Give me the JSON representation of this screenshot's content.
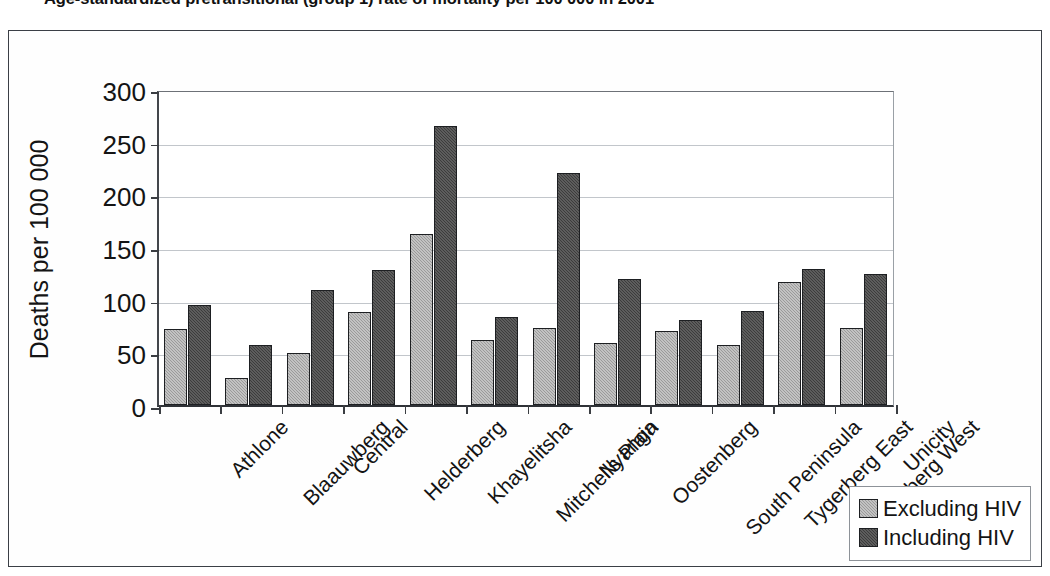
{
  "chart_data": {
    "type": "bar",
    "title": "Age-standardized pretransitional (group 1) rate of mortality per 100 000 in 2001",
    "xlabel": "",
    "ylabel": "Deaths per 100 000",
    "ylim": [
      0,
      300
    ],
    "ytick_values": [
      0,
      50,
      100,
      150,
      200,
      250,
      300
    ],
    "ytick_labels": [
      "0",
      "50",
      "100",
      "150",
      "200",
      "250",
      "300"
    ],
    "grid": "horizontal",
    "legend_position": "bottom-right",
    "categories": [
      "Athlone",
      "Blaauwberg",
      "Central",
      "Helderberg",
      "Khayelitsha",
      "Mitchells Plain",
      "Nyanga",
      "Oostenberg",
      "South Peninsula",
      "Tygerberg East",
      "Tygerberg West",
      "Unicity"
    ],
    "series": [
      {
        "name": "Excluding HIV",
        "color": "#9a9a9a",
        "values": [
          72,
          26,
          49,
          88,
          162,
          62,
          73,
          59,
          70,
          57,
          117,
          73
        ]
      },
      {
        "name": "Including HIV",
        "color": "#3c3c3c",
        "values": [
          95,
          57,
          109,
          128,
          265,
          84,
          220,
          120,
          81,
          89,
          129,
          124
        ]
      }
    ]
  },
  "legend": {
    "entries": [
      {
        "label": "Excluding HIV"
      },
      {
        "label": "Including HIV"
      }
    ]
  }
}
